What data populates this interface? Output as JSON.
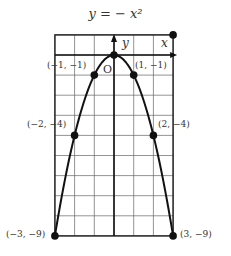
{
  "chart_data": {
    "type": "line",
    "title": "y = − x²",
    "function": "y = -x^2",
    "xlabel": "x",
    "ylabel": "y",
    "origin_label": "O",
    "xlim": [
      -3,
      3
    ],
    "ylim": [
      -9,
      1
    ],
    "grid": true,
    "points": [
      {
        "x": -3,
        "y": -9,
        "label": "(−3, −9)"
      },
      {
        "x": -2,
        "y": -4,
        "label": "(−2, −4)"
      },
      {
        "x": -1,
        "y": -1,
        "label": "(−1, −1)"
      },
      {
        "x": 0,
        "y": 0,
        "label": ""
      },
      {
        "x": 1,
        "y": -1,
        "label": "(1, −1)"
      },
      {
        "x": 2,
        "y": -4,
        "label": "(2, −4)"
      },
      {
        "x": 3,
        "y": -9,
        "label": "(3, −9)"
      }
    ],
    "extra_marker": {
      "x": 3,
      "y": 1
    }
  },
  "labels": {
    "title": "y = − x²",
    "x_axis": "x",
    "y_axis": "y",
    "origin": "O",
    "p_m1": "(−1, −1)",
    "p_1": "(1, −1)",
    "p_m2": "(−2, −4)",
    "p_2": "(2, −4)",
    "p_m3": "(−3, −9)",
    "p_3": "(3, −9)"
  }
}
